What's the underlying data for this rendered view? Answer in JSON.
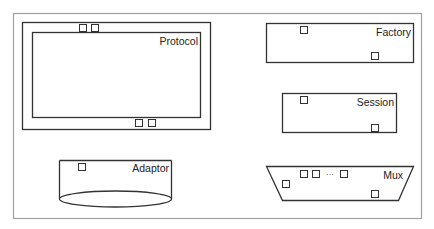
{
  "colors": {
    "stroke": "#333333",
    "frame": "#999999",
    "background": "#ffffff"
  },
  "diagram": {
    "frame": {
      "x": 13,
      "y": 13,
      "w": 408,
      "h": 205
    },
    "components": [
      {
        "id": "protocol",
        "label": "Protocol",
        "shape": "double-rectangle"
      },
      {
        "id": "factory",
        "label": "Factory",
        "shape": "rectangle"
      },
      {
        "id": "session",
        "label": "Session",
        "shape": "rectangle"
      },
      {
        "id": "adaptor",
        "label": "Adaptor",
        "shape": "cylinder"
      },
      {
        "id": "mux",
        "label": "Mux",
        "shape": "trapezoid",
        "ellipsis": "···"
      }
    ]
  }
}
